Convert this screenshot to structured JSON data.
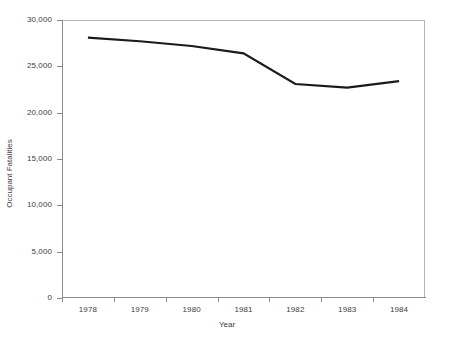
{
  "chart_data": {
    "type": "line",
    "title": "",
    "subtitle": "",
    "xlabel": "Year",
    "ylabel": "Occupant Fatalities",
    "categories": [
      "1978",
      "1979",
      "1980",
      "1981",
      "1982",
      "1983",
      "1984"
    ],
    "series": [
      {
        "name": "Occupant Fatalities",
        "values": [
          28100,
          27700,
          27200,
          26400,
          23100,
          22700,
          23400
        ],
        "color": "#1a1a1a"
      }
    ],
    "ylim": [
      0,
      30000
    ],
    "yticks": [
      0,
      5000,
      10000,
      15000,
      20000,
      25000,
      30000
    ],
    "ytick_labels": [
      "0",
      "5,000",
      "10,000",
      "15,000",
      "20,000",
      "25,000",
      "30,000"
    ],
    "xtick_labels": [
      "1978",
      "1979",
      "1980",
      "1981",
      "1982",
      "1983",
      "1984"
    ],
    "grid": false,
    "legend": "none",
    "axis_color": "#8a8a8a",
    "plot_border_color": "#b5b5b5",
    "text_color": "#3d3d3d",
    "background": "#ffffff"
  },
  "axes": {
    "x_title": "Year",
    "y_title": "Occupant Fatalities"
  }
}
